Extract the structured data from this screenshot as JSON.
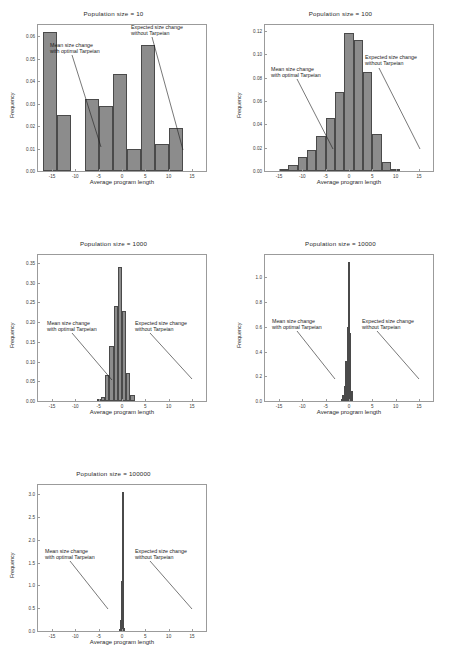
{
  "figure": {
    "axis_labels": {
      "x": "Average program length",
      "y": "Frequency"
    },
    "annotations": {
      "mean": "Mean size change\nwith optimal Tarpeian",
      "expected": "Expected size change\nwithout Tarpeian"
    },
    "colors": {
      "bar_fill": "#8c8c8c",
      "bar_edge": "#4a4a4a",
      "axis": "#9b9b9b",
      "text": "#1d1d1d"
    }
  },
  "chart_data": [
    {
      "id": "pop10",
      "type": "bar",
      "title": "Population size = 10",
      "xlabel": "Average program length",
      "ylabel": "Frequency",
      "xlim": [
        -18,
        18
      ],
      "ylim": [
        0,
        0.065
      ],
      "xticks": [
        -15,
        -10,
        -5,
        0,
        5,
        10,
        15
      ],
      "xtick_labels": [
        "-15",
        "-10",
        "-5",
        "0",
        "5",
        "10",
        "15"
      ],
      "yticks": [
        0.0,
        0.01,
        0.02,
        0.03,
        0.04,
        0.05,
        0.06
      ],
      "ytick_labels": [
        "0.00",
        "0.01",
        "0.02",
        "0.03",
        "0.04",
        "0.05",
        "0.06"
      ],
      "bin_edges": [
        -17,
        -14,
        -11,
        -8,
        -5,
        -2,
        1,
        4,
        7,
        10,
        13,
        16
      ],
      "values": [
        0.062,
        0.025,
        0.0,
        0.032,
        0.029,
        0.043,
        0.01,
        0.056,
        0.012,
        0.019,
        0.0
      ],
      "grid": false,
      "mean_marker_x": -4.0,
      "expected_marker_x": 14.2
    },
    {
      "id": "pop100",
      "type": "bar",
      "title": "Population size = 100",
      "xlabel": "Average program length",
      "ylabel": "Frequency",
      "xlim": [
        -18,
        18
      ],
      "ylim": [
        0,
        0.125
      ],
      "xticks": [
        -15,
        -10,
        -5,
        0,
        5,
        10,
        15
      ],
      "xtick_labels": [
        "-15",
        "-10",
        "-5",
        "0",
        "5",
        "10",
        "15"
      ],
      "yticks": [
        0.0,
        0.02,
        0.04,
        0.06,
        0.08,
        0.1,
        0.12
      ],
      "ytick_labels": [
        "0.00",
        "0.02",
        "0.04",
        "0.06",
        "0.08",
        "0.10",
        "0.12"
      ],
      "bin_edges": [
        -15,
        -13,
        -11,
        -9,
        -7,
        -5,
        -3,
        -1,
        1,
        3,
        5,
        7,
        9,
        11
      ],
      "values": [
        0.002,
        0.005,
        0.012,
        0.018,
        0.03,
        0.045,
        0.068,
        0.118,
        0.112,
        0.085,
        0.032,
        0.008,
        0.001
      ],
      "grid": false,
      "mean_marker_x": -0.6,
      "expected_marker_x": 16.3
    },
    {
      "id": "pop1000",
      "type": "bar",
      "title": "Population size = 1000",
      "xlabel": "Average program length",
      "ylabel": "Frequency",
      "xlim": [
        -18,
        18
      ],
      "ylim": [
        0,
        0.37
      ],
      "xticks": [
        -15,
        -10,
        -5,
        0,
        5,
        10,
        15
      ],
      "xtick_labels": [
        "-15",
        "-10",
        "-5",
        "0",
        "5",
        "10",
        "15"
      ],
      "yticks": [
        0.0,
        0.05,
        0.1,
        0.15,
        0.2,
        0.25,
        0.3,
        0.35
      ],
      "ytick_labels": [
        "0.00",
        "0.05",
        "0.10",
        "0.15",
        "0.20",
        "0.25",
        "0.30",
        "0.35"
      ],
      "bin_edges": [
        -5.4,
        -4.5,
        -3.6,
        -2.7,
        -1.8,
        -0.9,
        0.0,
        0.9,
        1.8,
        2.7
      ],
      "values": [
        0.005,
        0.01,
        0.065,
        0.14,
        0.24,
        0.34,
        0.228,
        0.072,
        0.016
      ],
      "grid": false,
      "mean_marker_x": -0.3,
      "expected_marker_x": 16.3
    },
    {
      "id": "pop10000",
      "type": "bar",
      "title": "Population size = 10000",
      "xlabel": "Average program length",
      "ylabel": "Frequency",
      "xlim": [
        -18,
        18
      ],
      "ylim": [
        0,
        1.18
      ],
      "xticks": [
        -15,
        -10,
        -5,
        0,
        5,
        10,
        15
      ],
      "xtick_labels": [
        "-15",
        "-10",
        "-5",
        "0",
        "5",
        "10",
        "15"
      ],
      "yticks": [
        0.0,
        0.2,
        0.4,
        0.6,
        0.8,
        1.0
      ],
      "ytick_labels": [
        "0.0",
        "0.2",
        "0.4",
        "0.6",
        "0.8",
        "1.0"
      ],
      "bin_edges": [
        -1.7,
        -1.4,
        -1.1,
        -0.8,
        -0.5,
        -0.2,
        0.1,
        0.4,
        0.7
      ],
      "values": [
        0.02,
        0.05,
        0.12,
        0.32,
        0.6,
        1.12,
        0.55,
        0.08
      ],
      "grid": false,
      "mean_marker_x": -0.1,
      "expected_marker_x": 16.3
    },
    {
      "id": "pop100000",
      "type": "bar",
      "title": "Population size = 100000",
      "xlabel": "Average program length",
      "ylabel": "Frequency",
      "xlim": [
        -18,
        18
      ],
      "ylim": [
        0,
        3.2
      ],
      "xticks": [
        -15,
        -10,
        -5,
        0,
        5,
        10,
        15
      ],
      "xtick_labels": [
        "-15",
        "-10",
        "-5",
        "0",
        "5",
        "10",
        "15"
      ],
      "yticks": [
        0.0,
        0.5,
        1.0,
        1.5,
        2.0,
        2.5,
        3.0
      ],
      "ytick_labels": [
        "0.0",
        "0.5",
        "1.0",
        "1.5",
        "2.0",
        "2.5",
        "3.0"
      ],
      "bin_edges": [
        -0.55,
        -0.4,
        -0.25,
        -0.1,
        0.05,
        0.2,
        0.35
      ],
      "values": [
        0.05,
        0.25,
        1.1,
        3.05,
        0.45,
        0.06
      ],
      "grid": false,
      "mean_marker_x": -0.05,
      "expected_marker_x": 16.3
    }
  ]
}
